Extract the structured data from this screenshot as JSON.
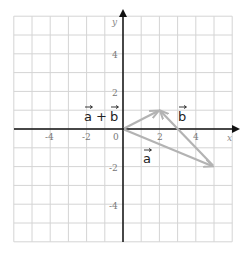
{
  "diagram": {
    "type": "vector-addition-grid",
    "grid": {
      "xmin": -6,
      "xmax": 6,
      "ymin": -6,
      "ymax": 6,
      "step": 1
    },
    "axes": {
      "x_label": "x",
      "y_label": "y",
      "origin_label": "0",
      "x_ticks": [
        {
          "value": -4,
          "label": "-4"
        },
        {
          "value": -2,
          "label": "-2"
        },
        {
          "value": 2,
          "label": "2"
        },
        {
          "value": 4,
          "label": "4"
        }
      ],
      "y_ticks": [
        {
          "value": 4,
          "label": "4"
        },
        {
          "value": 2,
          "label": "2"
        },
        {
          "value": -2,
          "label": "-2"
        },
        {
          "value": -4,
          "label": "-4"
        }
      ]
    },
    "vectors": [
      {
        "name": "a",
        "label": "a",
        "from": [
          0,
          0
        ],
        "to": [
          5,
          -2
        ]
      },
      {
        "name": "b",
        "label": "b",
        "from": [
          5,
          -2
        ],
        "to": [
          2,
          1
        ]
      },
      {
        "name": "a-plus-b",
        "label": "a + b",
        "from": [
          0,
          0
        ],
        "to": [
          2,
          1
        ]
      }
    ],
    "labels": {
      "a": "a",
      "b": "b",
      "sum_a": "a",
      "sum_plus": "+",
      "sum_b": "b"
    },
    "colors": {
      "grid": "#d4d4d4",
      "axis": "#111111",
      "vector": "#b3b3b3",
      "text": "#222222"
    }
  }
}
